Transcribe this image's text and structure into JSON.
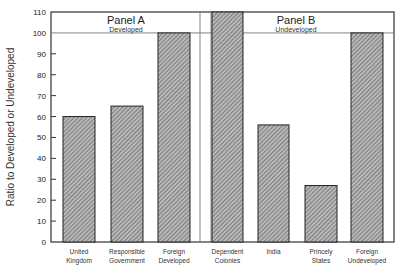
{
  "chart_data": {
    "type": "bar",
    "title": "",
    "xlabel": "",
    "ylabel": "Ratio to Developed or Undeveloped",
    "ylim": [
      0,
      110
    ],
    "yticks": [
      0,
      10,
      20,
      30,
      40,
      50,
      60,
      70,
      80,
      90,
      100,
      110
    ],
    "grid": false,
    "reference_line": 100,
    "panels": [
      {
        "title": "Panel A",
        "subtitle": "Developed",
        "categories": [
          "United Kingdom",
          "Responsible Government",
          "Foreign Developed"
        ],
        "category_lines": [
          [
            "United",
            "Kingdom"
          ],
          [
            "Responsible",
            "Government"
          ],
          [
            "Foreign",
            "Developed"
          ]
        ],
        "values": [
          60,
          65,
          100
        ]
      },
      {
        "title": "Panel B",
        "subtitle": "Undeveloped",
        "categories": [
          "Dependent Colonies",
          "India",
          "Princely States",
          "Foreign Undeveloped"
        ],
        "category_lines": [
          [
            "Dependent",
            "Colonies"
          ],
          [
            "India"
          ],
          [
            "Princely",
            "States"
          ],
          [
            "Foreign",
            "Undeveloped"
          ]
        ],
        "values": [
          110,
          56,
          27,
          100
        ],
        "notes": "Dependent Colonies bar extends beyond top of axis (clipped at 110)"
      }
    ],
    "bar_fill": "hatched gray",
    "colors": {
      "bar_fill": "#9a9a9a",
      "bar_edge": "#222222",
      "axis": "#333333"
    }
  }
}
